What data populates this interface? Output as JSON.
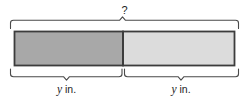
{
  "diagram": {
    "type": "tape-diagram",
    "total_bracket": {
      "label": "?",
      "name": "total-length-unknown"
    },
    "segments": [
      {
        "name": "left-segment",
        "label_variable": "y",
        "label_unit": "in.",
        "fill_color": "#a8a8a8",
        "border_color": "#3c3c3c"
      },
      {
        "name": "right-segment",
        "label_variable": "y",
        "label_unit": "in.",
        "fill_color": "#dcdcdc",
        "border_color": "#3c3c3c"
      }
    ],
    "background_color": "#ffffff",
    "bracket_color": "#4a4a4a"
  }
}
